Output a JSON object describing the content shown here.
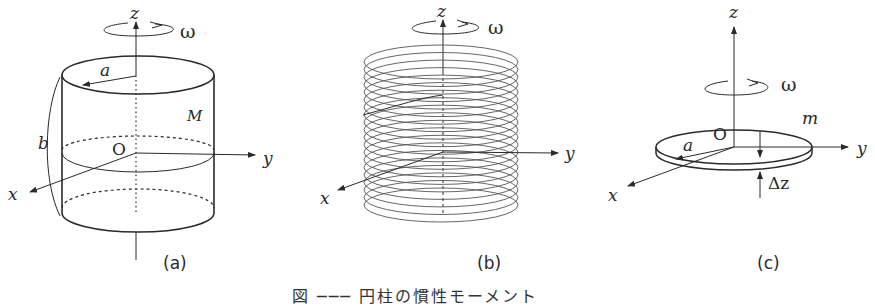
{
  "figure": {
    "caption": "図 ─── 円柱の慣性モーメント",
    "line_color": "#2a2a2a",
    "panels": [
      {
        "id": "a",
        "sublabel": "(a)",
        "description": "solid cylinder of radius a, height b, mass M rotating about z-axis",
        "labels": {
          "z": "z",
          "omega": "ω",
          "radius": "a",
          "mass": "M",
          "height": "b",
          "origin": "O",
          "y": "y",
          "x": "x"
        }
      },
      {
        "id": "b",
        "sublabel": "(b)",
        "description": "cylinder decomposed into a stack of thin rings (coil) rotating about z-axis",
        "ring_count": 20,
        "labels": {
          "z": "z",
          "omega": "ω",
          "y": "y",
          "x": "x"
        }
      },
      {
        "id": "c",
        "sublabel": "(c)",
        "description": "thin disk of radius a, thickness Δz, mass m rotating about z-axis",
        "labels": {
          "z": "z",
          "omega": "ω",
          "mass": "m",
          "origin": "O",
          "radius": "a",
          "y": "y",
          "x": "x",
          "thickness": "Δz"
        }
      }
    ]
  }
}
